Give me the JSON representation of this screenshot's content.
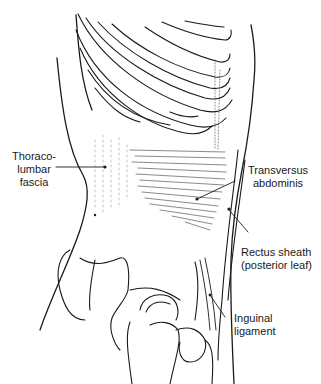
{
  "figure": {
    "line_color": "#1a1a1a",
    "background": "#ffffff"
  },
  "labels": [
    {
      "id": "thoracolumbar-fascia",
      "lines": [
        "Thoraco-",
        "lumbar",
        "fascia"
      ]
    },
    {
      "id": "transversus-abdominis",
      "lines": [
        "Transversus",
        "abdominis"
      ]
    },
    {
      "id": "rectus-sheath",
      "lines": [
        "Rectus sheath",
        "(posterior leaf)"
      ]
    },
    {
      "id": "inguinal-ligament",
      "lines": [
        "Inguinal",
        "ligament"
      ]
    }
  ]
}
